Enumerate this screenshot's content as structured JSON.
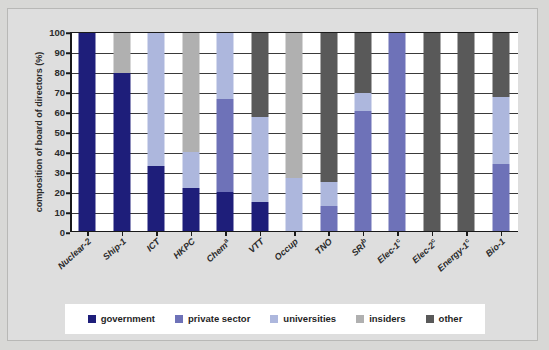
{
  "chart_data": {
    "type": "bar",
    "subtype": "stacked-100-percent",
    "title": "",
    "xlabel": "",
    "ylabel": "composition of board of directors (%)",
    "ylim": [
      0,
      100
    ],
    "yticks": [
      0,
      10,
      20,
      30,
      40,
      50,
      60,
      70,
      80,
      90,
      100
    ],
    "grid": true,
    "legend_position": "bottom",
    "categories": [
      "Nuclear-2",
      "Ship-1",
      "ICT",
      "HKPC",
      "Chemᵃ",
      "VTT",
      "Occup",
      "TNO",
      "SRIᵇ",
      "Elec-1ᶜ",
      "Elec-2ᶜ",
      "Energy-1ᶜ",
      "Bio-1"
    ],
    "category_labels": [
      {
        "text": "Nuclear-2",
        "sup": ""
      },
      {
        "text": "Ship-1",
        "sup": ""
      },
      {
        "text": "ICT",
        "sup": ""
      },
      {
        "text": "HKPC",
        "sup": ""
      },
      {
        "text": "Chem",
        "sup": "a"
      },
      {
        "text": "VTT",
        "sup": ""
      },
      {
        "text": "Occup",
        "sup": ""
      },
      {
        "text": "TNO",
        "sup": ""
      },
      {
        "text": "SRI",
        "sup": "b"
      },
      {
        "text": "Elec-1",
        "sup": "c"
      },
      {
        "text": "Elec-2",
        "sup": "c"
      },
      {
        "text": "Energy-1",
        "sup": "c"
      },
      {
        "text": "Bio-1",
        "sup": ""
      }
    ],
    "series": [
      {
        "name": "government",
        "color": "#1e1e7a",
        "values": [
          100,
          80,
          33,
          22,
          20,
          15,
          0,
          0,
          0,
          0,
          0,
          0,
          0
        ]
      },
      {
        "name": "private sector",
        "color": "#6e72b8",
        "values": [
          0,
          0,
          0,
          0,
          47,
          0,
          0,
          13,
          61,
          100,
          0,
          0,
          34
        ]
      },
      {
        "name": "universities",
        "color": "#adb7dd",
        "values": [
          0,
          0,
          67,
          18,
          33,
          43,
          27,
          12,
          9,
          0,
          0,
          0,
          34
        ]
      },
      {
        "name": "insiders",
        "color": "#b0b0b0",
        "values": [
          0,
          20,
          0,
          60,
          0,
          0,
          73,
          0,
          0,
          0,
          0,
          0,
          0
        ]
      },
      {
        "name": "other",
        "color": "#595959",
        "values": [
          0,
          0,
          0,
          0,
          0,
          42,
          0,
          75,
          30,
          0,
          100,
          100,
          32
        ]
      }
    ]
  },
  "legend": {
    "items": [
      {
        "label": "government",
        "color": "#1e1e7a"
      },
      {
        "label": "private sector",
        "color": "#6e72b8"
      },
      {
        "label": "universities",
        "color": "#adb7dd"
      },
      {
        "label": "insiders",
        "color": "#b0b0b0"
      },
      {
        "label": "other",
        "color": "#595959"
      }
    ]
  }
}
